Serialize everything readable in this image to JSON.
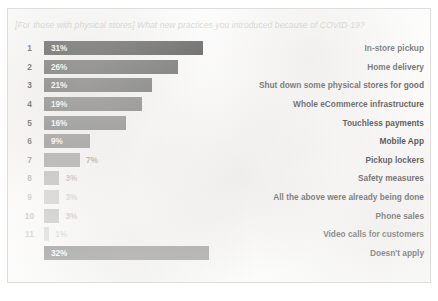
{
  "chart_data": {
    "type": "bar",
    "title": "[For those with physical stores] What new practices you introduced because of COVID-19?",
    "xlabel": "",
    "ylabel": "",
    "orientation": "horizontal",
    "grid": false,
    "legend": false,
    "xlim": [
      0,
      35
    ],
    "categories": [
      "In-store pickup",
      "Home delivery",
      "Shut down some physical stores for good",
      "Whole eCommerce infrastructure",
      "Touchless payments",
      "Mobile App",
      "Pickup lockers",
      "Safety measures",
      "All the above were already being done",
      "Phone sales",
      "Video calls for customers",
      "Doesn't apply"
    ],
    "values": [
      31,
      26,
      21,
      19,
      16,
      9,
      7,
      3,
      3,
      3,
      1,
      32
    ],
    "value_labels": [
      "31%",
      "26%",
      "21%",
      "19%",
      "16%",
      "9%",
      "7%",
      "3%",
      "3%",
      "3%",
      "1%",
      "32%"
    ],
    "ranks": [
      "1",
      "2",
      "3",
      "4",
      "5",
      "6",
      "7",
      "8",
      "9",
      "10",
      "11",
      ""
    ],
    "bar_colors": [
      "#141414",
      "#3c3c3c",
      "#525252",
      "#6d6d6d",
      "#7e7e7e",
      "#949494",
      "#a8a8a8",
      "#bdbdbd",
      "#cfcfcf",
      "#c4c4c4",
      "#d8d8d8",
      "#838383"
    ],
    "label_colors": [
      "#1c1c1c",
      "#1c1c1c",
      "#1c1c1c",
      "#1c1c1c",
      "#1c1c1c",
      "#1f1f1f",
      "#2b2b2b",
      "#333333",
      "#383838",
      "#333333",
      "#3a3a3a",
      "#272727"
    ],
    "rank_colors": [
      "#111111",
      "#1a1a1a",
      "#222222",
      "#3a3a3a",
      "#505050",
      "#6f6f6f",
      "#949494",
      "#b4b4b4",
      "#c4c4c4",
      "#bcbcbc",
      "#c9c9c9",
      ""
    ],
    "value_inside": [
      true,
      true,
      true,
      true,
      true,
      true,
      false,
      false,
      false,
      false,
      false,
      true
    ]
  }
}
